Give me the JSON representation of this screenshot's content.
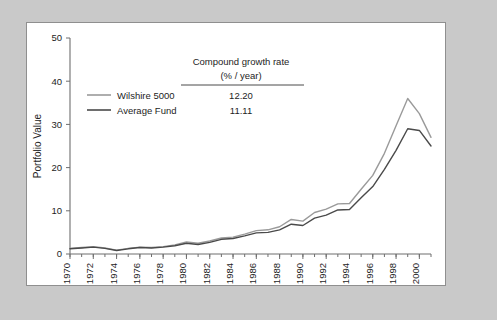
{
  "figure": {
    "background_color": "#c9c9c9",
    "panel_color": "#ffffff",
    "border_color": "#8f8f8f"
  },
  "chart_data": {
    "type": "line",
    "title": "",
    "xlabel": "",
    "ylabel": "Portfolio Value",
    "xlim": [
      1970,
      2001
    ],
    "ylim": [
      0,
      50
    ],
    "yticks": [
      0,
      10,
      20,
      30,
      40,
      50
    ],
    "ytick_labels": [
      "0",
      "10",
      "20",
      "30",
      "40",
      "50"
    ],
    "xticks": [
      1970,
      1972,
      1974,
      1976,
      1978,
      1980,
      1982,
      1984,
      1986,
      1988,
      1990,
      1992,
      1994,
      1996,
      1998,
      2000
    ],
    "xtick_labels": [
      "1970",
      "1972",
      "1974",
      "1976",
      "1978",
      "1980",
      "1982",
      "1984",
      "1986",
      "1988",
      "1990",
      "1992",
      "1994",
      "1996",
      "1998",
      "2000"
    ],
    "minor_xticks_every": 1,
    "grid": false,
    "legend_position": "upper-left-inside",
    "x": [
      1970,
      1971,
      1972,
      1973,
      1974,
      1975,
      1976,
      1977,
      1978,
      1979,
      1980,
      1981,
      1982,
      1983,
      1984,
      1985,
      1986,
      1987,
      1988,
      1989,
      1990,
      1991,
      1992,
      1993,
      1994,
      1995,
      1996,
      1997,
      1998,
      1999,
      2000,
      2001
    ],
    "series": [
      {
        "name": "Wilshire 5000",
        "color": "#9a9a9a",
        "line_width": 1.4,
        "growth_rate": "12.20",
        "values": [
          1.3,
          1.5,
          1.7,
          1.4,
          0.9,
          1.3,
          1.6,
          1.5,
          1.7,
          2.1,
          2.8,
          2.5,
          3.0,
          3.7,
          3.9,
          4.6,
          5.4,
          5.6,
          6.3,
          8.0,
          7.6,
          9.6,
          10.4,
          11.6,
          11.7,
          15.0,
          18.2,
          23.3,
          29.7,
          36.0,
          32.5,
          27.0
        ]
      },
      {
        "name": "Average Fund",
        "color": "#4a4a4a",
        "line_width": 1.4,
        "growth_rate": "11.11",
        "values": [
          1.2,
          1.4,
          1.6,
          1.3,
          0.8,
          1.2,
          1.5,
          1.4,
          1.6,
          1.9,
          2.5,
          2.2,
          2.7,
          3.4,
          3.6,
          4.2,
          4.9,
          5.0,
          5.6,
          6.9,
          6.6,
          8.3,
          9.0,
          10.2,
          10.3,
          13.0,
          15.6,
          19.6,
          24.0,
          29.0,
          28.6,
          25.0
        ]
      }
    ],
    "annotation": {
      "heading_line1": "Compound growth rate",
      "heading_line2": "(% / year)",
      "rows": [
        {
          "label": "Wilshire 5000",
          "value": "12.20"
        },
        {
          "label": "Average Fund",
          "value": "11.11"
        }
      ]
    }
  }
}
